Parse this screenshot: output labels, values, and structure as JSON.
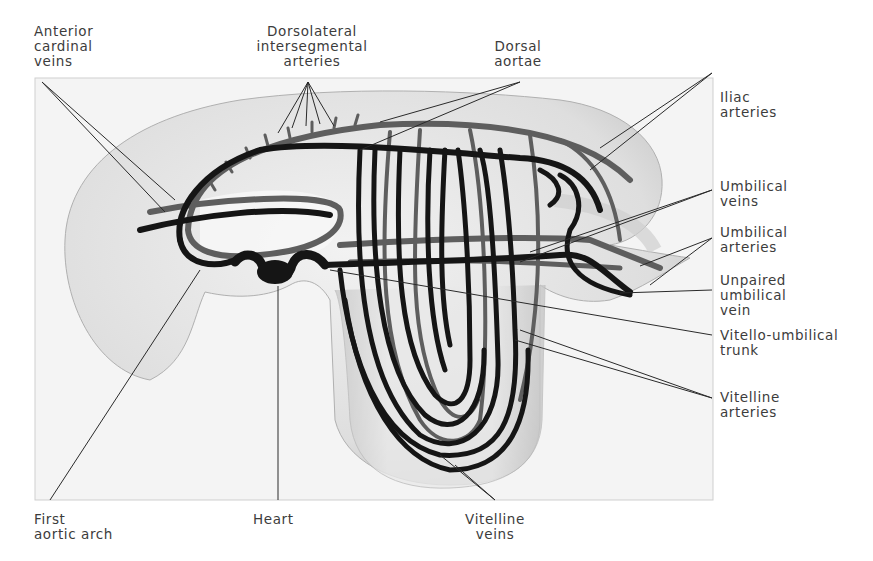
{
  "figure": {
    "colors": {
      "background": "#ffffff",
      "panel": "#f3f3f3",
      "embryo_body": "#e4e4e4",
      "embryo_shade": "#bdbdbd",
      "vein_dark": "#151515",
      "artery_grey": "#5e5e5e",
      "leader_line": "#2a2a2a",
      "label_text": "#3c3c3c"
    }
  },
  "labels": {
    "anterior_cardinal_veins": [
      "Anterior",
      "cardinal",
      "veins"
    ],
    "dorsolateral_intersegmental_arteries": [
      "Dorsolateral",
      "intersegmental",
      "arteries"
    ],
    "dorsal_aortae": [
      "Dorsal",
      "aortae"
    ],
    "iliac_arteries": [
      "Iliac",
      "arteries"
    ],
    "umbilical_veins": [
      "Umbilical",
      "veins"
    ],
    "umbilical_arteries": [
      "Umbilical",
      "arteries"
    ],
    "unpaired_umbilical_vein": [
      "Unpaired",
      "umbilical",
      "vein"
    ],
    "vitello_umbilical_trunk": [
      "Vitello-umbilical",
      "trunk"
    ],
    "vitelline_arteries": [
      "Vitelline",
      "arteries"
    ],
    "first_aortic_arch": [
      "First",
      "aortic arch"
    ],
    "heart": [
      "Heart"
    ],
    "vitelline_veins": [
      "Vitelline",
      "veins"
    ]
  }
}
